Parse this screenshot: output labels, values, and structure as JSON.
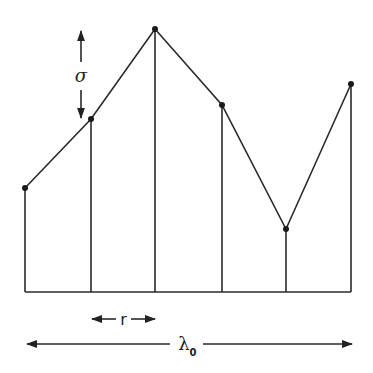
{
  "diagram": {
    "points": [
      {
        "x": 25,
        "y": 188
      },
      {
        "x": 91,
        "y": 119
      },
      {
        "x": 155,
        "y": 29
      },
      {
        "x": 222,
        "y": 105
      },
      {
        "x": 286,
        "y": 229
      },
      {
        "x": 351,
        "y": 84
      }
    ],
    "baseline_y": 292,
    "line_color": "#2a2a2a",
    "labels": {
      "sigma": "σ",
      "r": "r",
      "lambda": "λ",
      "lambda_subscript": "0"
    }
  }
}
